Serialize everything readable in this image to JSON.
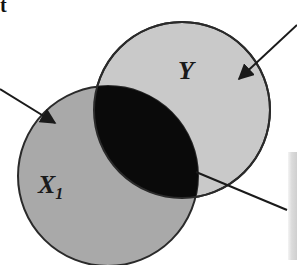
{
  "figure": {
    "heading_fragment": "t",
    "sets": [
      {
        "id": "Y",
        "label": "Y",
        "fill": "#c9c9c9",
        "cx": 182,
        "cy": 110,
        "r": 88
      },
      {
        "id": "X1",
        "label_main": "X",
        "label_sub": "1",
        "fill": "#a9a9a9",
        "cx": 108,
        "cy": 176,
        "r": 90
      }
    ],
    "intersection": {
      "fill": "#0a0a0a"
    },
    "arrows": [
      {
        "name": "arrow-to-x1",
        "from": [
          0,
          89
        ],
        "to": [
          55,
          123
        ]
      },
      {
        "name": "arrow-to-y",
        "from": [
          297,
          25
        ],
        "to": [
          239,
          79
        ]
      }
    ],
    "pointer_line": {
      "from": [
        196,
        172
      ],
      "to": [
        287,
        210
      ]
    },
    "colors": {
      "stroke": "#2a2a2a",
      "background": "#ffffff"
    }
  }
}
